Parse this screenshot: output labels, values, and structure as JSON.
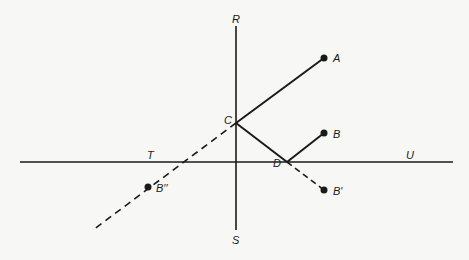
{
  "diagram": {
    "lines": {
      "horizontal": {
        "from": "T",
        "to": "U",
        "x1": 20,
        "y1": 162,
        "x2": 453,
        "y2": 162,
        "style": "solid"
      },
      "vertical": {
        "from": "R",
        "to": "S",
        "x1": 236,
        "y1": 26,
        "x2": 236,
        "y2": 230,
        "style": "solid"
      },
      "A_to_C": {
        "x1": 324,
        "y1": 58,
        "x2": 236,
        "y2": 123,
        "style": "solid"
      },
      "C_to_D": {
        "x1": 236,
        "y1": 123,
        "x2": 287,
        "y2": 162,
        "style": "solid"
      },
      "D_to_B": {
        "x1": 287,
        "y1": 162,
        "x2": 324,
        "y2": 133,
        "style": "solid"
      },
      "D_to_Bprime": {
        "x1": 287,
        "y1": 162,
        "x2": 324,
        "y2": 190,
        "style": "dashed"
      },
      "C_to_Bdoubleprime": {
        "x1": 236,
        "y1": 123,
        "x2": 93,
        "y2": 230,
        "style": "dashed"
      }
    },
    "points": [
      {
        "name": "A",
        "label": "A",
        "x": 324,
        "y": 58,
        "dot": true
      },
      {
        "name": "B",
        "label": "B",
        "x": 324,
        "y": 133,
        "dot": true
      },
      {
        "name": "B-prime",
        "label": "B′",
        "x": 324,
        "y": 190,
        "dot": true
      },
      {
        "name": "B-double-prime",
        "label": "B′′",
        "x": 148,
        "y": 187,
        "dot": true
      },
      {
        "name": "C",
        "label": "C",
        "x": 236,
        "y": 123,
        "dot": false
      },
      {
        "name": "D",
        "label": "D",
        "x": 287,
        "y": 162,
        "dot": false
      }
    ],
    "labels": {
      "R": "R",
      "S": "S",
      "T": "T",
      "U": "U",
      "A": "A",
      "B": "B",
      "B_prime": "B′",
      "B_double_prime": "B′′",
      "C": "C",
      "D": "D"
    },
    "colors": {
      "ink": "#1a1a1a",
      "background": "#f7f7f5"
    }
  }
}
